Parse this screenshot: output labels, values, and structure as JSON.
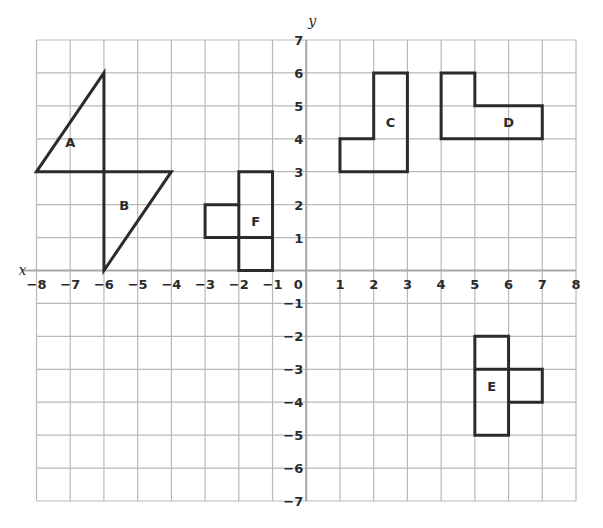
{
  "axes": {
    "x_label": "x",
    "y_label": "y",
    "x_range": [
      -8,
      8
    ],
    "y_range": [
      -7,
      7
    ],
    "origin_label": "0",
    "x_ticks": [
      "−8",
      "−7",
      "−6",
      "−5",
      "−4",
      "−3",
      "−2",
      "−1",
      "1",
      "2",
      "3",
      "4",
      "5",
      "6",
      "7",
      "8"
    ],
    "y_ticks": [
      "7",
      "6",
      "5",
      "4",
      "3",
      "2",
      "1",
      "−1",
      "−2",
      "−3",
      "−4",
      "−5",
      "−6",
      "−7"
    ]
  },
  "shapes": [
    {
      "label": "A",
      "points": [
        [
          -8,
          3
        ],
        [
          -6,
          6
        ],
        [
          -6,
          3
        ]
      ],
      "label_pos": [
        -7,
        3.9
      ]
    },
    {
      "label": "B",
      "points": [
        [
          -6,
          3
        ],
        [
          -4,
          3
        ],
        [
          -6,
          0
        ]
      ],
      "label_pos": [
        -5.4,
        2
      ]
    },
    {
      "label": "C",
      "points": [
        [
          1,
          3
        ],
        [
          3,
          3
        ],
        [
          3,
          6
        ],
        [
          2,
          6
        ],
        [
          2,
          4
        ],
        [
          1,
          4
        ]
      ],
      "label_pos": [
        2.5,
        4.5
      ]
    },
    {
      "label": "D",
      "points": [
        [
          4,
          4
        ],
        [
          7,
          4
        ],
        [
          7,
          5
        ],
        [
          5,
          5
        ],
        [
          5,
          6
        ],
        [
          4,
          6
        ]
      ],
      "label_pos": [
        6,
        4.5
      ]
    },
    {
      "label": "E",
      "points": [
        [
          5,
          -2
        ],
        [
          6,
          -2
        ],
        [
          6,
          -3
        ],
        [
          7,
          -3
        ],
        [
          7,
          -4
        ],
        [
          6,
          -4
        ],
        [
          6,
          -5
        ],
        [
          5,
          -5
        ]
      ],
      "inner": [
        [
          [
            5,
            -3
          ],
          [
            6,
            -3
          ]
        ],
        [
          [
            6,
            -3
          ],
          [
            6,
            -4
          ]
        ]
      ],
      "label_pos": [
        5.5,
        -3.5
      ]
    },
    {
      "label": "F",
      "points": [
        [
          -2,
          3
        ],
        [
          -1,
          3
        ],
        [
          -1,
          0
        ],
        [
          -2,
          0
        ],
        [
          -2,
          1
        ],
        [
          -3,
          1
        ],
        [
          -3,
          2
        ],
        [
          -2,
          2
        ]
      ],
      "inner": [
        [
          [
            -2,
            2
          ],
          [
            -2,
            1
          ]
        ],
        [
          [
            -2,
            1
          ],
          [
            -1,
            1
          ]
        ]
      ],
      "label_pos": [
        -1.5,
        1.5
      ]
    }
  ]
}
